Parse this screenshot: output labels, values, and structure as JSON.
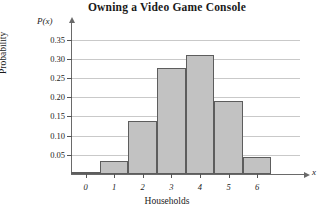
{
  "chart_data": {
    "type": "bar",
    "title": "Owning a Video Game Console",
    "xlabel": "Households",
    "ylabel": "Probability",
    "x_axis_variable": "x",
    "y_axis_variable": "P(x)",
    "categories": [
      "0",
      "1",
      "2",
      "3",
      "4",
      "5",
      "6"
    ],
    "values": [
      0.005,
      0.035,
      0.138,
      0.277,
      0.31,
      0.19,
      0.044
    ],
    "ylim": [
      0,
      0.375
    ],
    "yticks": [
      "0.05",
      "0.10",
      "0.15",
      "0.20",
      "0.25",
      "0.30",
      "0.35"
    ],
    "ytick_values": [
      0.05,
      0.1,
      0.15,
      0.2,
      0.25,
      0.3,
      0.35
    ],
    "grid": true,
    "legend": null,
    "bar_fill": "#c2c2c2",
    "bar_stroke": "#5d5d5d",
    "grid_color": "#c9c9c9",
    "axis_color": "#6a6a6a"
  }
}
